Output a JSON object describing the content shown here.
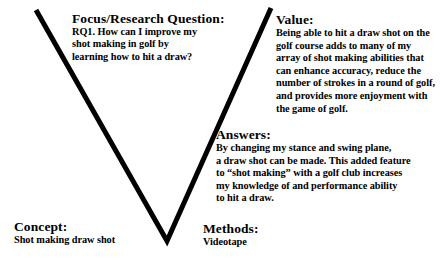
{
  "diagram": {
    "type": "gowin-vee-diagram",
    "background_color": "#ffffff",
    "stroke_color": "#000000",
    "text_color": "#000000",
    "vee": {
      "left_arm_top": [
        36,
        10
      ],
      "vertex": [
        167,
        241
      ],
      "right_arm_top": [
        271,
        8
      ],
      "stroke_width": 5
    }
  },
  "blocks": {
    "focus": {
      "heading": "Focus/Research Question:",
      "lines": [
        "RQ1. How can I improve my",
        "shot making in golf by",
        "learning how to hit a draw?"
      ]
    },
    "value": {
      "heading": "Value:",
      "lines": [
        "Being able to hit a draw shot on the",
        "golf course adds to many of my",
        "array of shot making abilities that",
        "can enhance accuracy, reduce the",
        "number of strokes in a round of golf,",
        "and provides more enjoyment with",
        "the game of golf."
      ]
    },
    "answers": {
      "heading": "Answers:",
      "lines": [
        "By changing my stance and swing plane,",
        "a draw shot can be made. This added feature",
        "to “shot making” with a golf club increases",
        "my knowledge of and performance ability",
        "to hit a draw."
      ]
    },
    "concept": {
      "heading": "Concept:",
      "lines": [
        "Shot making draw shot"
      ]
    },
    "methods": {
      "heading": "Methods:",
      "lines": [
        "Videotape"
      ]
    }
  }
}
